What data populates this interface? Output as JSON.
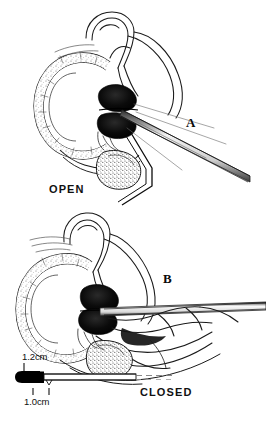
{
  "figure": {
    "background_color": "#ffffff",
    "ink_color": "#111111",
    "mass_color": "#000000"
  },
  "panels": [
    {
      "id": "A",
      "letter": "A",
      "state_label": "OPEN",
      "description": "Cross-section of ring-shaped muscular wall with dark bilobed mass on the right and an instrument shaft entering diagonally from lower right"
    },
    {
      "id": "B",
      "letter": "B",
      "state_label": "CLOSED",
      "description": "Same cross-section with dark bilobed mass apposed and instrument shaft lying horizontally from the right"
    }
  ],
  "scale": {
    "upper_value": "1.2cm",
    "lower_value": "1.0cm",
    "tip_color": "#000000",
    "rod_color": "#111111"
  }
}
